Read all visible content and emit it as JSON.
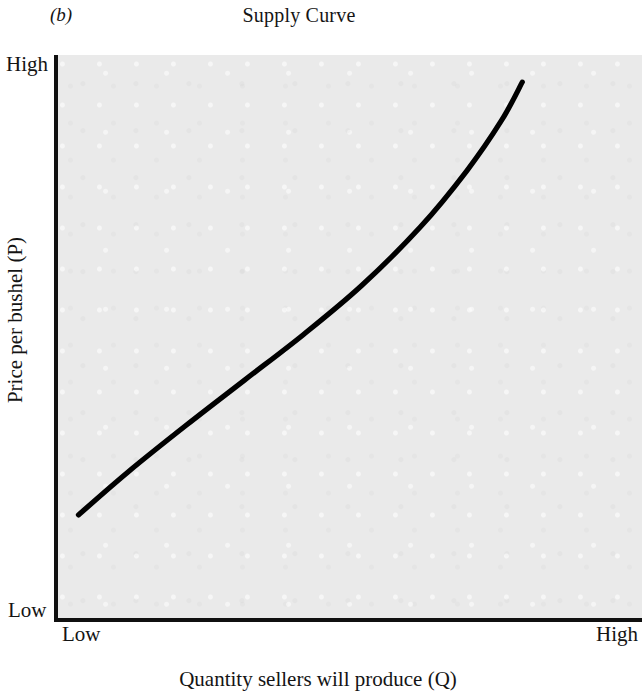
{
  "figure": {
    "panel_label": "(b)",
    "title": "Supply Curve"
  },
  "axes": {
    "y_title": "Price per bushel (P)",
    "x_title": "Quantity sellers will produce (Q)",
    "y_tick_high": "High",
    "y_tick_low": "Low",
    "x_tick_low": "Low",
    "x_tick_high": "High"
  },
  "colors": {
    "plot_background": "#eaeaea",
    "axis": "#101010",
    "curve": "#000000",
    "page_background": "#ffffff"
  },
  "chart_data": {
    "type": "line",
    "title": "Supply Curve",
    "xlabel": "Quantity sellers will produce (Q)",
    "ylabel": "Price per bushel (P)",
    "xlim": [
      0,
      1
    ],
    "ylim": [
      0,
      1
    ],
    "xticks": [
      0,
      1
    ],
    "xticklabels": [
      "Low",
      "High"
    ],
    "yticks": [
      0,
      1
    ],
    "yticklabels": [
      "Low",
      "High"
    ],
    "grid": false,
    "legend": false,
    "annotations": [
      "(b)"
    ],
    "series": [
      {
        "name": "Supply",
        "shape": "upward-sloping convex curve",
        "x": [
          0.035,
          0.12,
          0.22,
          0.32,
          0.42,
          0.52,
          0.62,
          0.7,
          0.76,
          0.795
        ],
        "y": [
          0.186,
          0.262,
          0.345,
          0.425,
          0.505,
          0.592,
          0.695,
          0.795,
          0.885,
          0.952
        ]
      }
    ]
  }
}
